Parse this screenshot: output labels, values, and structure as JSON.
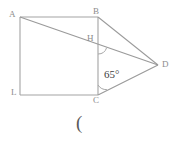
{
  "figure": {
    "type": "geometry-diagram",
    "background_color": "#ffffff",
    "stroke_color": "#a0a0a0",
    "label_color": "#8c8c8c",
    "angle_text_color": "#3d3d3d",
    "vertices": [
      {
        "id": "A",
        "label": "A",
        "x": 20,
        "y": 17
      },
      {
        "id": "B",
        "label": "B",
        "x": 98,
        "y": 17
      },
      {
        "id": "C",
        "label": "C",
        "x": 98,
        "y": 95
      },
      {
        "id": "D",
        "label": "D",
        "x": 158,
        "y": 65
      },
      {
        "id": "H",
        "label": "H",
        "x": 98,
        "y": 45
      },
      {
        "id": "L",
        "label": "L",
        "x": 20,
        "y": 95
      }
    ],
    "segments": [
      {
        "from": "A",
        "to": "B",
        "name": "top-side"
      },
      {
        "from": "B",
        "to": "C",
        "name": "right-side-of-square"
      },
      {
        "from": "C",
        "to": "L",
        "name": "bottom-side"
      },
      {
        "from": "L",
        "to": "A",
        "name": "left-side"
      },
      {
        "from": "A",
        "to": "D",
        "name": "diagonal-a-to-d"
      },
      {
        "from": "B",
        "to": "D",
        "name": "segment-b-to-d"
      },
      {
        "from": "C",
        "to": "D",
        "name": "segment-c-to-d"
      }
    ],
    "angles": [
      {
        "at": "C",
        "label": "65°",
        "value": 65,
        "unit": "degrees"
      },
      {
        "at": "H",
        "label": "",
        "marked": true
      }
    ],
    "caption": "("
  }
}
